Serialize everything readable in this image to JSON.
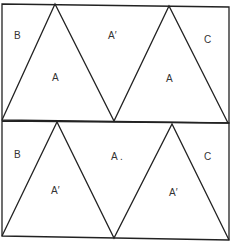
{
  "diagram": {
    "stroke_color": "#222222",
    "background": "#ffffff",
    "panels": [
      {
        "name": "top-panel",
        "labels": {
          "left_corner": "B",
          "triangle_1": "A",
          "middle_inverted": "A′",
          "triangle_2": "A",
          "right_corner": "C"
        }
      },
      {
        "name": "bottom-panel",
        "labels": {
          "left_corner": "B",
          "triangle_1": "A′",
          "middle_inverted": "A .",
          "triangle_2": "A′",
          "right_corner": "C"
        }
      }
    ]
  }
}
